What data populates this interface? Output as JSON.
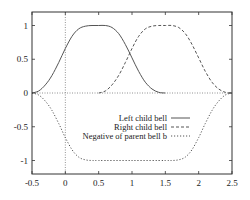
{
  "chart_data": {
    "type": "line",
    "title": "",
    "xlabel": "",
    "ylabel": "",
    "xlim": [
      -0.5,
      2.5
    ],
    "ylim": [
      -1.2,
      1.2
    ],
    "xticks": [
      -0.5,
      0,
      0.5,
      1,
      1.5,
      2,
      2.5
    ],
    "xtick_labels": [
      "-0.5",
      "0",
      "0.5",
      "1",
      "1.5",
      "2",
      "2.5"
    ],
    "yticks": [
      -1,
      -0.5,
      0,
      0.5,
      1
    ],
    "ytick_labels": [
      "-1",
      "-0.5",
      "0",
      "0.5",
      "1"
    ],
    "grid": false,
    "zero_axes": true,
    "legend_position": "inside-center-right",
    "series": [
      {
        "name": "Left child bell",
        "style": "solid",
        "color": "#555555",
        "x": [
          -0.5,
          -0.4,
          -0.3,
          -0.2,
          -0.1,
          0,
          0.1,
          0.2,
          0.3,
          0.4,
          0.5,
          0.6,
          0.7,
          0.8,
          0.9,
          1.0,
          1.1,
          1.2,
          1.3,
          1.4,
          1.5
        ],
        "y": [
          0,
          0.03,
          0.12,
          0.26,
          0.45,
          0.66,
          0.84,
          0.95,
          0.99,
          1,
          1,
          1,
          0.97,
          0.88,
          0.72,
          0.52,
          0.32,
          0.16,
          0.06,
          0.01,
          0
        ]
      },
      {
        "name": "Right child bell",
        "style": "dashed",
        "color": "#555555",
        "x": [
          0.5,
          0.6,
          0.7,
          0.8,
          0.9,
          1.0,
          1.1,
          1.2,
          1.3,
          1.4,
          1.5,
          1.6,
          1.7,
          1.8,
          1.9,
          2.0,
          2.1,
          2.2,
          2.3,
          2.4,
          2.5
        ],
        "y": [
          0,
          0.03,
          0.12,
          0.26,
          0.45,
          0.66,
          0.84,
          0.95,
          0.99,
          1,
          1,
          1,
          0.97,
          0.88,
          0.72,
          0.52,
          0.32,
          0.16,
          0.06,
          0.01,
          0
        ]
      },
      {
        "name": "Negative of parent bell b",
        "style": "dotted",
        "color": "#555555",
        "x": [
          -0.5,
          -0.4,
          -0.3,
          -0.2,
          -0.1,
          0,
          0.1,
          0.2,
          0.3,
          0.4,
          0.5,
          1.0,
          1.5,
          1.6,
          1.7,
          1.8,
          1.9,
          2.0,
          2.1,
          2.2,
          2.3,
          2.4,
          2.5
        ],
        "y": [
          0,
          -0.03,
          -0.12,
          -0.26,
          -0.45,
          -0.66,
          -0.84,
          -0.95,
          -0.99,
          -1,
          -1,
          -1,
          -1,
          -1,
          -0.99,
          -0.95,
          -0.84,
          -0.66,
          -0.45,
          -0.26,
          -0.12,
          -0.03,
          0
        ]
      }
    ]
  },
  "legend": {
    "items": [
      {
        "label": "Left child bell",
        "style": "solid"
      },
      {
        "label": "Right child bell",
        "style": "dashed"
      },
      {
        "label": "Negative of parent bell b",
        "style": "dotted"
      }
    ]
  }
}
